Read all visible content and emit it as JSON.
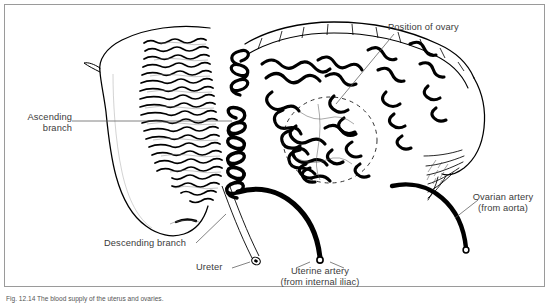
{
  "figure": {
    "caption": "Fig. 12.14  The blood supply of the uterus and ovaries.",
    "frame_color": "#9a9a9a",
    "ink_color": "#000000",
    "label_color": "#3b3b3b",
    "background": "#ffffff"
  },
  "labels": [
    {
      "id": "ascending-branch",
      "line1": "Ascending",
      "line2": "branch",
      "align": "right"
    },
    {
      "id": "descending-branch",
      "line1": "Descending branch",
      "line2": "",
      "align": "left"
    },
    {
      "id": "ureter",
      "line1": "Ureter",
      "line2": "",
      "align": "left"
    },
    {
      "id": "position-of-ovary",
      "line1": "Position of ovary",
      "line2": "",
      "align": "left"
    },
    {
      "id": "uterine-artery",
      "line1": "Uterine artery",
      "line2": "(from internal iliac)",
      "align": "center"
    },
    {
      "id": "ovarian-artery",
      "line1": "Ovarian artery",
      "line2": "(from aorta)",
      "align": "center"
    }
  ],
  "structures": [
    {
      "id": "uterus-body",
      "name": "Uterus (body and cervix)"
    },
    {
      "id": "uterine-tube",
      "name": "Uterine (fallopian) tube"
    },
    {
      "id": "fimbriae",
      "name": "Fimbriae of uterine tube"
    },
    {
      "id": "ovary",
      "name": "Ovary (dashed outline)"
    },
    {
      "id": "arcuate-arteries",
      "name": "Arcuate / spiral arteries of myometrium"
    },
    {
      "id": "helicine-trunk",
      "name": "Coiled ascending branch of uterine artery"
    },
    {
      "id": "uterine-artery-trunk",
      "name": "Uterine artery trunk (cut)"
    },
    {
      "id": "ovarian-artery-trunk",
      "name": "Ovarian artery trunk (cut)"
    },
    {
      "id": "ureter-tube",
      "name": "Ureter (cut end)"
    }
  ]
}
